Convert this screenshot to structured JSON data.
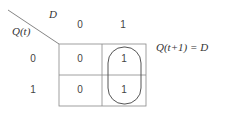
{
  "kmap": {
    "row_variable": "Q(t)",
    "col_variable": "D",
    "col_headers": [
      "0",
      "1"
    ],
    "row_headers": [
      "0",
      "1"
    ],
    "cells": [
      [
        "0",
        "1"
      ],
      [
        "0",
        "1"
      ]
    ],
    "grouping": "column D=1 circled",
    "equation": "Q(t+1) = D"
  },
  "colors": {
    "line": "#555555",
    "text": "#444444"
  }
}
